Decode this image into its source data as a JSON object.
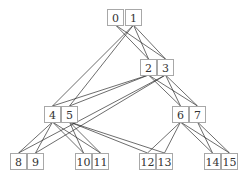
{
  "diagram": {
    "type": "layered-graph",
    "colors": {
      "edge": "#2e2e2e",
      "node_border": "#a8a8a8",
      "node_text": "#333333",
      "background": "#ffffff"
    },
    "node_size": {
      "w": 17,
      "h": 16
    },
    "nodes": [
      {
        "id": "0",
        "label": "0",
        "x": 107,
        "y": 9
      },
      {
        "id": "1",
        "label": "1",
        "x": 125,
        "y": 9
      },
      {
        "id": "2",
        "label": "2",
        "x": 140,
        "y": 59
      },
      {
        "id": "3",
        "label": "3",
        "x": 157,
        "y": 59
      },
      {
        "id": "4",
        "label": "4",
        "x": 44,
        "y": 106
      },
      {
        "id": "5",
        "label": "5",
        "x": 61,
        "y": 106
      },
      {
        "id": "6",
        "label": "6",
        "x": 172,
        "y": 106
      },
      {
        "id": "7",
        "label": "7",
        "x": 189,
        "y": 106
      },
      {
        "id": "8",
        "label": "8",
        "x": 10,
        "y": 153
      },
      {
        "id": "9",
        "label": "9",
        "x": 27,
        "y": 153
      },
      {
        "id": "10",
        "label": "10",
        "x": 75,
        "y": 153
      },
      {
        "id": "11",
        "label": "11",
        "x": 92,
        "y": 153
      },
      {
        "id": "12",
        "label": "12",
        "x": 139,
        "y": 153
      },
      {
        "id": "13",
        "label": "13",
        "x": 156,
        "y": 153
      },
      {
        "id": "14",
        "label": "14",
        "x": 204,
        "y": 153
      },
      {
        "id": "15",
        "label": "15",
        "x": 221,
        "y": 153
      }
    ],
    "edges": [
      [
        "0",
        "2"
      ],
      [
        "0",
        "3"
      ],
      [
        "1",
        "2"
      ],
      [
        "1",
        "3"
      ],
      [
        "1",
        "4"
      ],
      [
        "1",
        "5"
      ],
      [
        "2",
        "4"
      ],
      [
        "2",
        "5"
      ],
      [
        "2",
        "6"
      ],
      [
        "2",
        "7"
      ],
      [
        "3",
        "6"
      ],
      [
        "3",
        "7"
      ],
      [
        "3",
        "8"
      ],
      [
        "3",
        "9"
      ],
      [
        "4",
        "8"
      ],
      [
        "4",
        "9"
      ],
      [
        "4",
        "10"
      ],
      [
        "4",
        "11"
      ],
      [
        "5",
        "10"
      ],
      [
        "5",
        "11"
      ],
      [
        "5",
        "12"
      ],
      [
        "5",
        "13"
      ],
      [
        "6",
        "12"
      ],
      [
        "6",
        "13"
      ],
      [
        "6",
        "14"
      ],
      [
        "6",
        "15"
      ],
      [
        "7",
        "14"
      ],
      [
        "7",
        "15"
      ]
    ]
  }
}
